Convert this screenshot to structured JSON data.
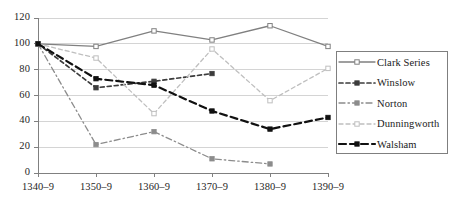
{
  "chart_data": {
    "type": "line",
    "title": "",
    "xlabel": "",
    "ylabel": "",
    "ylim": [
      0,
      120
    ],
    "ytick_step": 20,
    "yticks": [
      "0",
      "20",
      "40",
      "60",
      "80",
      "100",
      "120"
    ],
    "grid": true,
    "legend_position": "right",
    "categories": [
      "1340–9",
      "1350–9",
      "1360–9",
      "1370–9",
      "1380–9",
      "1390–9"
    ],
    "series": [
      {
        "name": "Clark Series",
        "values": [
          100,
          98,
          110,
          103,
          114,
          98
        ],
        "color": "#808080",
        "line_style": "solid",
        "marker": "open-square"
      },
      {
        "name": "Winslow",
        "values": [
          100,
          66,
          71,
          77,
          null,
          null
        ],
        "color": "#3c3c3c",
        "line_style": "dashed",
        "marker": "filled-square"
      },
      {
        "name": "Norton",
        "values": [
          100,
          22,
          32,
          11,
          7,
          null
        ],
        "color": "#8c8c8c",
        "line_style": "dash-dot",
        "marker": "filled-square"
      },
      {
        "name": "Dunningworth",
        "values": [
          100,
          89,
          46,
          96,
          56,
          81
        ],
        "color": "#bfbfbf",
        "line_style": "dashed",
        "marker": "open-square"
      },
      {
        "name": "Walsham",
        "values": [
          100,
          73,
          68,
          48,
          34,
          43
        ],
        "color": "#111111",
        "line_style": "long-dash",
        "marker": "filled-square"
      }
    ]
  },
  "axis": {
    "line_color": "#808080",
    "grid_color": "#d4d4d4"
  }
}
